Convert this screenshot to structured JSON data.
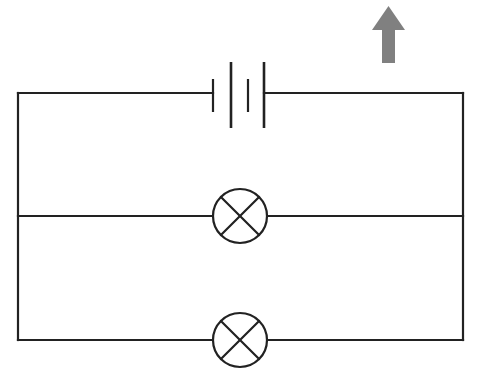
{
  "diagram": {
    "type": "electrical-circuit-schematic",
    "background_color": "#FFFFFF",
    "wire_color": "#222222",
    "wire_width": 2.2,
    "annotation_color": "#808080"
  },
  "canvas": {
    "width": 485,
    "height": 388
  },
  "circuit": {
    "outer_loop": {
      "name": "outer-rectangle-wire",
      "left_x": 18,
      "right_x": 463,
      "top_y": 93,
      "bottom_y": 340
    },
    "middle_branch": {
      "name": "middle-branch-wire",
      "y": 216,
      "left_x": 18,
      "right_x": 463
    },
    "battery": {
      "name": "battery-two-cell",
      "label": "battery",
      "cells": 2,
      "center_y": 95,
      "plates": [
        {
          "type": "short",
          "x": 213,
          "y1": 79,
          "y2": 112,
          "width": 2.2
        },
        {
          "type": "long",
          "x": 231,
          "y1": 62,
          "y2": 128,
          "width": 2.6
        },
        {
          "type": "short",
          "x": 248,
          "y1": 79,
          "y2": 112,
          "width": 2.2
        },
        {
          "type": "long",
          "x": 264,
          "y1": 62,
          "y2": 128,
          "width": 2.6
        }
      ],
      "lead_left_from_x": 18,
      "lead_left_to_x": 213,
      "lead_right_from_x": 264,
      "lead_right_to_x": 463
    },
    "lamps": [
      {
        "name": "lamp-upper",
        "label": "lamp",
        "branch": "middle",
        "cx": 240,
        "cy": 216,
        "r": 27,
        "cross": true
      },
      {
        "name": "lamp-lower",
        "label": "lamp",
        "branch": "bottom",
        "cx": 240,
        "cy": 340,
        "r": 27,
        "cross": true
      }
    ]
  },
  "annotations": {
    "arrow": {
      "name": "up-arrow-annotation",
      "label": "up arrow",
      "direction": "up",
      "color": "#808080",
      "x": 372,
      "y": 6,
      "width": 33,
      "height": 57,
      "shaft_width": 13,
      "head_height": 24
    }
  }
}
